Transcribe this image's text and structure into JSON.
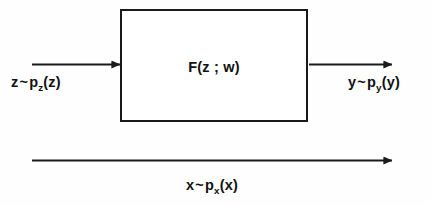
{
  "diagram": {
    "type": "block-diagram",
    "background_color": "#fefefe",
    "stroke_color": "#1a1a1a",
    "text_color": "#111111"
  },
  "transform_block": {
    "label_full": "F(z ; w)",
    "function_name": "F",
    "open_paren": "(",
    "argument": "z",
    "separator": " ; ",
    "parameter": "w",
    "close_paren": ")",
    "border_color": "#1a1a1a",
    "fill_color": "#ffffff"
  },
  "input": {
    "label_full": "z ~ p_z(z)",
    "variable": "z",
    "tilde": "~",
    "density_symbol": "p",
    "density_subscript": "z",
    "density_arg": "(z)",
    "arrow_name": "input-arrow"
  },
  "output": {
    "label_full": "y ~ p_y(y)",
    "variable": "y",
    "tilde": "~",
    "density_symbol": "p",
    "density_subscript": "y",
    "density_arg": "(y)",
    "arrow_name": "output-arrow"
  },
  "data_flow": {
    "label_full": "x ~ p_x(x)",
    "variable": "x",
    "tilde": "~",
    "density_symbol": "p",
    "density_subscript": "x",
    "density_arg": "(x)",
    "arrow_name": "data-arrow"
  }
}
